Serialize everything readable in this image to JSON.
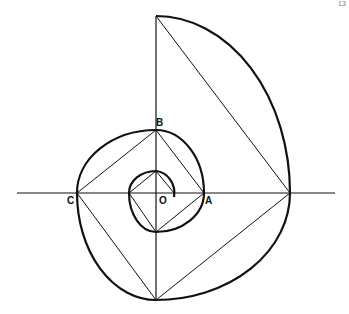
{
  "diagram": {
    "labels": {
      "O": "O",
      "A": "A",
      "B": "B",
      "C": "C"
    },
    "page_number": "13",
    "colors": {
      "line": "#111111",
      "background": "#ffffff"
    }
  }
}
